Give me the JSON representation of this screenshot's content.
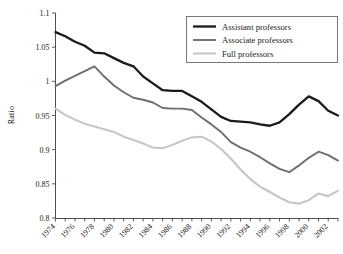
{
  "chart_data": {
    "type": "line",
    "title": "",
    "xlabel": "",
    "ylabel": "Ratio",
    "ylim": [
      0.8,
      1.1
    ],
    "xlim": [
      1974,
      2003
    ],
    "yticks": [
      "0.8",
      "0.85",
      "0.9",
      "0.95",
      "1",
      "1.05",
      "1.1"
    ],
    "ytick_values": [
      0.8,
      0.85,
      0.9,
      0.95,
      1.0,
      1.05,
      1.1
    ],
    "grid": false,
    "legend_position": "top-right",
    "x": [
      1974,
      1975,
      1976,
      1977,
      1978,
      1979,
      1980,
      1981,
      1982,
      1983,
      1984,
      1985,
      1986,
      1987,
      1988,
      1989,
      1990,
      1991,
      1992,
      1993,
      1994,
      1995,
      1996,
      1997,
      1998,
      1999,
      2000,
      2001,
      2002,
      2003
    ],
    "xtick_labels": [
      "1974",
      "1976",
      "1978",
      "1980",
      "1982",
      "1984",
      "1986",
      "1988",
      "1990",
      "1992",
      "1994",
      "1996",
      "1998",
      "2000",
      "2002"
    ],
    "xtick_values": [
      1974,
      1976,
      1978,
      1980,
      1982,
      1984,
      1986,
      1988,
      1990,
      1992,
      1994,
      1996,
      1998,
      2000,
      2002
    ],
    "series": [
      {
        "name": "Assistant professors",
        "color": "#1a1a1a",
        "width": 2.3,
        "values": [
          1.072,
          1.066,
          1.058,
          1.052,
          1.042,
          1.041,
          1.034,
          1.027,
          1.022,
          1.007,
          0.997,
          0.987,
          0.986,
          0.986,
          0.978,
          0.97,
          0.959,
          0.948,
          0.942,
          0.941,
          0.94,
          0.937,
          0.935,
          0.94,
          0.952,
          0.966,
          0.978,
          0.971,
          0.957,
          0.95
        ]
      },
      {
        "name": "Associate professors",
        "color": "#6e6e6e",
        "width": 1.9,
        "values": [
          0.993,
          1.001,
          1.008,
          1.015,
          1.022,
          1.007,
          0.994,
          0.984,
          0.976,
          0.973,
          0.969,
          0.961,
          0.96,
          0.96,
          0.958,
          0.947,
          0.937,
          0.926,
          0.911,
          0.903,
          0.897,
          0.889,
          0.88,
          0.872,
          0.867,
          0.877,
          0.888,
          0.897,
          0.892,
          0.884
        ]
      },
      {
        "name": "Full professors",
        "color": "#c6c6c6",
        "width": 2.1,
        "values": [
          0.96,
          0.951,
          0.944,
          0.938,
          0.934,
          0.93,
          0.926,
          0.919,
          0.914,
          0.909,
          0.903,
          0.902,
          0.907,
          0.913,
          0.918,
          0.919,
          0.912,
          0.901,
          0.887,
          0.871,
          0.857,
          0.846,
          0.838,
          0.83,
          0.823,
          0.821,
          0.826,
          0.836,
          0.832,
          0.84
        ]
      }
    ],
    "series_extra_note": ""
  },
  "legend": {
    "items": [
      {
        "label": "Assistant professors"
      },
      {
        "label": "Associate professors"
      },
      {
        "label": "Full professors"
      }
    ]
  },
  "axis": {
    "ylabel": "Ratio"
  }
}
